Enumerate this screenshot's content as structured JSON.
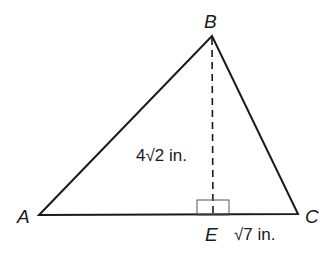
{
  "diagram": {
    "type": "triangle",
    "vertices": {
      "A": {
        "label": "A",
        "x": 39,
        "y": 215
      },
      "B": {
        "label": "B",
        "x": 212,
        "y": 36
      },
      "C": {
        "label": "C",
        "x": 298,
        "y": 214
      }
    },
    "foot_of_altitude": {
      "label": "E",
      "x": 213,
      "y": 215
    },
    "altitude": {
      "from": "B",
      "to": "E",
      "style": "dashed",
      "length_label": "4√2 in."
    },
    "segment_EC": {
      "length_label": "√7 in."
    },
    "right_angle_marker": {
      "at": "E"
    },
    "colors": {
      "stroke": "#1a1a1a",
      "background": "#ffffff"
    }
  }
}
